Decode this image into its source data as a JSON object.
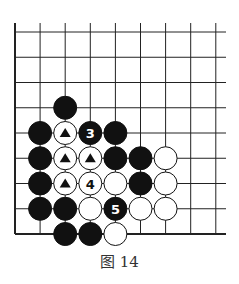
{
  "caption": "图 14",
  "board": {
    "columns": 9,
    "rows": 9,
    "origin_x": 15,
    "origin_y": 32,
    "spacing_x": 25.1,
    "spacing_y": 25.25,
    "line_top": 23,
    "line_right": 226,
    "stone_radius": 11.5,
    "line_color": "#222222",
    "black_color": "#111111",
    "white_color": "#ffffff"
  },
  "stones": [
    {
      "col": 2,
      "row": 3,
      "color": "black",
      "label": ""
    },
    {
      "col": 1,
      "row": 4,
      "color": "black",
      "label": ""
    },
    {
      "col": 2,
      "row": 4,
      "color": "white",
      "label": "▲"
    },
    {
      "col": 3,
      "row": 4,
      "color": "black",
      "label": "3"
    },
    {
      "col": 4,
      "row": 4,
      "color": "black",
      "label": ""
    },
    {
      "col": 1,
      "row": 5,
      "color": "black",
      "label": ""
    },
    {
      "col": 2,
      "row": 5,
      "color": "white",
      "label": "▲"
    },
    {
      "col": 3,
      "row": 5,
      "color": "white",
      "label": "▲"
    },
    {
      "col": 4,
      "row": 5,
      "color": "black",
      "label": ""
    },
    {
      "col": 5,
      "row": 5,
      "color": "black",
      "label": ""
    },
    {
      "col": 6,
      "row": 5,
      "color": "white",
      "label": ""
    },
    {
      "col": 1,
      "row": 6,
      "color": "black",
      "label": ""
    },
    {
      "col": 2,
      "row": 6,
      "color": "white",
      "label": "▲"
    },
    {
      "col": 3,
      "row": 6,
      "color": "white",
      "label": "4"
    },
    {
      "col": 4,
      "row": 6,
      "color": "white",
      "label": ""
    },
    {
      "col": 5,
      "row": 6,
      "color": "black",
      "label": ""
    },
    {
      "col": 6,
      "row": 6,
      "color": "white",
      "label": ""
    },
    {
      "col": 1,
      "row": 7,
      "color": "black",
      "label": ""
    },
    {
      "col": 2,
      "row": 7,
      "color": "black",
      "label": ""
    },
    {
      "col": 3,
      "row": 7,
      "color": "white",
      "label": ""
    },
    {
      "col": 4,
      "row": 7,
      "color": "black",
      "label": "5"
    },
    {
      "col": 5,
      "row": 7,
      "color": "white",
      "label": ""
    },
    {
      "col": 6,
      "row": 7,
      "color": "white",
      "label": ""
    },
    {
      "col": 2,
      "row": 8,
      "color": "black",
      "label": ""
    },
    {
      "col": 3,
      "row": 8,
      "color": "black",
      "label": ""
    },
    {
      "col": 4,
      "row": 8,
      "color": "white",
      "label": ""
    }
  ]
}
